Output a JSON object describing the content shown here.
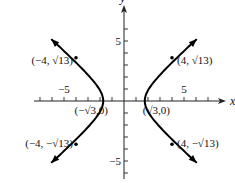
{
  "figure": {
    "type": "hyperbola-graph",
    "equation": "x^2/3 - y^2/3 = 1",
    "axes": {
      "x_label": "x",
      "y_label": "y",
      "x_range": [
        -7.5,
        8.5
      ],
      "y_range": [
        -6.5,
        8
      ],
      "x_tick_labels": [
        {
          "value": -5,
          "text": "−5"
        },
        {
          "value": 5,
          "text": "5"
        }
      ],
      "y_tick_labels": [
        {
          "value": 5,
          "text": "5"
        },
        {
          "value": -5,
          "text": "−5"
        }
      ],
      "tick_step": 1
    },
    "curve_x_extent": 6.05,
    "points": [
      {
        "x": 4,
        "y": 3.6056,
        "label": "(4, √13)",
        "marker": true
      },
      {
        "x": -4,
        "y": 3.6056,
        "label": "(−4, √13)",
        "marker": true
      },
      {
        "x": 4,
        "y": -3.6056,
        "label": "(4, −√13)",
        "marker": true
      },
      {
        "x": -4,
        "y": -3.6056,
        "label": "(−4, −√13)",
        "marker": true
      },
      {
        "x": 1.7321,
        "y": 0,
        "label": "(√3,0)",
        "marker": false
      },
      {
        "x": -1.7321,
        "y": 0,
        "label": "(−√3,0)",
        "marker": false
      }
    ],
    "colors": {
      "curve": "#000000",
      "axis": "#222222",
      "text": "#111111"
    }
  }
}
